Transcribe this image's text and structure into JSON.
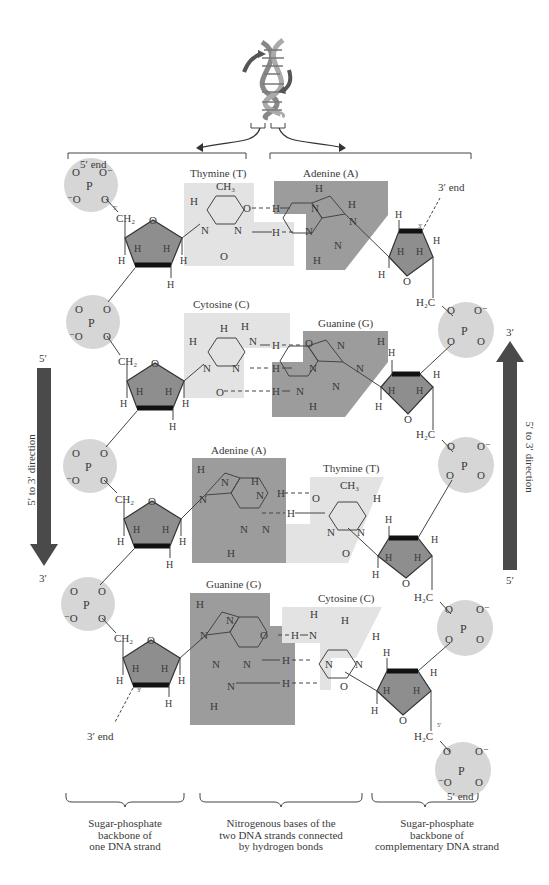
{
  "figure": {
    "top_bracket_labels": {
      "left_strand_end_top": "5′ end",
      "right_strand_end_top": "3′ end",
      "left_strand_end_bottom": "3′ end",
      "right_strand_end_bottom": "5′ end"
    },
    "base_pairs": [
      {
        "left": "Thymine (T)",
        "right": "Adenine (A)",
        "h_bonds": 2
      },
      {
        "left": "Cytosine (C)",
        "right": "Guanine (G)",
        "h_bonds": 3
      },
      {
        "left": "Adenine (A)",
        "right": "Thymine (T)",
        "h_bonds": 2
      },
      {
        "left": "Guanine (G)",
        "right": "Cytosine (C)",
        "h_bonds": 3
      }
    ],
    "direction_arrows": {
      "left": {
        "top": "5′",
        "bottom": "3′",
        "label": "5′ to 3′ direction",
        "orientation": "down"
      },
      "right": {
        "top": "3′",
        "bottom": "5′",
        "label": "5′ to 3′ direction",
        "orientation": "up"
      }
    },
    "atoms": {
      "phosphorus": "P",
      "oxygen": "O",
      "oxygen_neg": "O⁻",
      "neg_oxygen": "⁻O",
      "ch2": "CH₂",
      "h2c": "H₂C",
      "ch3": "CH₃",
      "hydrogen": "H",
      "nitrogen": "N",
      "prime3": "3′",
      "prime5": "5′"
    },
    "captions": [
      {
        "line1": "Sugar-phosphate",
        "line2": "backbone of",
        "line3": "one DNA strand"
      },
      {
        "line1": "Nitrogenous bases of the",
        "line2": "two DNA strands connected",
        "line3": "by hydrogen bonds"
      },
      {
        "line1": "Sugar-phosphate",
        "line2": "backbone of",
        "line3": "complementary DNA strand"
      }
    ],
    "colors": {
      "phosphate_circle": "#d6d6d6",
      "pyrimidine_shade": "#e3e3e3",
      "purine_shade": "#9c9c9c",
      "sugar_fill": "#8e8e8e",
      "arrow": "#4a4a4a",
      "ink": "#3a3a3a"
    }
  }
}
